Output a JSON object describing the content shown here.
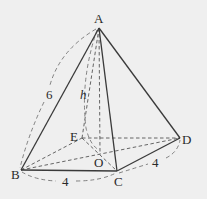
{
  "diagram": {
    "type": "pyramid",
    "colors": {
      "background": "#efefef",
      "line": "#3a3a3a",
      "dashed": "#555555",
      "label": "#2a2a2a"
    },
    "vertices": {
      "A": {
        "label": "A",
        "x": 99,
        "y": 28
      },
      "B": {
        "label": "B",
        "x": 21,
        "y": 170
      },
      "C": {
        "label": "C",
        "x": 117,
        "y": 171
      },
      "D": {
        "label": "D",
        "x": 180,
        "y": 138
      },
      "E": {
        "label": "E",
        "x": 82,
        "y": 138
      },
      "O": {
        "label": "O",
        "x": 100,
        "y": 152
      }
    },
    "measurements": {
      "lateral_edge_AB": "6",
      "height_AO": "h",
      "base_edge_BC": "4",
      "base_edge_CD": "4"
    },
    "solid_edges": [
      "AB",
      "AC",
      "AD",
      "BC",
      "CD"
    ],
    "hidden_edges": [
      "AE",
      "AO",
      "BE",
      "ED",
      "BD",
      "EC",
      "BO"
    ]
  }
}
